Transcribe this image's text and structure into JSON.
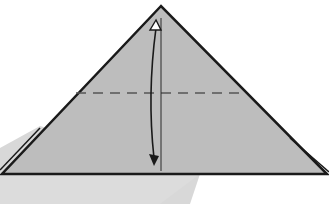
{
  "diagram": {
    "type": "origami-fold-step",
    "colors": {
      "background": "#ffffff",
      "paper": "#bdbdbd",
      "shadow": "#d6d6d6",
      "edge": "#1a1a1a",
      "fold_line": "#555555"
    },
    "elements": {
      "triangle": {
        "apex": [
          161,
          6
        ],
        "left": [
          0,
          174
        ],
        "right": [
          327,
          174
        ]
      },
      "valley_fold_line": {
        "y": 93,
        "x1": 76,
        "x2": 242,
        "style": "dashed"
      },
      "crease_line": {
        "x": 161,
        "y1": 18,
        "y2": 171
      },
      "arrow": {
        "type": "fold-and-unfold",
        "top": [
          156,
          22
        ],
        "bottom": [
          154,
          164
        ]
      }
    }
  }
}
